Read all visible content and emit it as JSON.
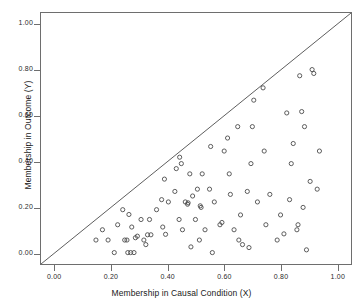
{
  "chart_data": {
    "type": "scatter",
    "title": "",
    "xlabel": "Membership in Causal Condition (X)",
    "ylabel": "Membership in Outcome (Y)",
    "xlim": [
      -0.05,
      1.05
    ],
    "ylim": [
      -0.05,
      1.05
    ],
    "xticks": [
      0.0,
      0.2,
      0.4,
      0.6,
      0.8,
      1.0
    ],
    "yticks": [
      0.0,
      0.2,
      0.4,
      0.6,
      0.8,
      1.0
    ],
    "xticklabels": [
      "0.00",
      "0.20",
      "0.40",
      "0.60",
      "0.80",
      "1.00"
    ],
    "yticklabels": [
      "0.00",
      "0.20",
      "0.40",
      "0.60",
      "0.80",
      "1.00"
    ],
    "grid": false,
    "legend": null,
    "marker": "open-circle",
    "marker_color": "#4a4a4a",
    "frame_color": "#6e6e6e",
    "reference_line": {
      "name": "y = x diagonal",
      "from": [
        -0.05,
        -0.05
      ],
      "to": [
        1.05,
        1.05
      ],
      "color": "#4a4a4a"
    },
    "points": [
      [
        0.145,
        0.055
      ],
      [
        0.168,
        0.1
      ],
      [
        0.188,
        0.055
      ],
      [
        0.21,
        0.0
      ],
      [
        0.222,
        0.122
      ],
      [
        0.24,
        0.188
      ],
      [
        0.247,
        0.055
      ],
      [
        0.255,
        0.055
      ],
      [
        0.258,
        0.0
      ],
      [
        0.262,
        0.167
      ],
      [
        0.268,
        0.0
      ],
      [
        0.272,
        0.112
      ],
      [
        0.28,
        0.0
      ],
      [
        0.285,
        0.065
      ],
      [
        0.292,
        0.072
      ],
      [
        0.305,
        0.145
      ],
      [
        0.315,
        0.055
      ],
      [
        0.322,
        0.035
      ],
      [
        0.328,
        0.078
      ],
      [
        0.335,
        0.145
      ],
      [
        0.34,
        0.078
      ],
      [
        0.36,
        0.188
      ],
      [
        0.378,
        0.232
      ],
      [
        0.382,
        0.112
      ],
      [
        0.388,
        0.322
      ],
      [
        0.392,
        0.08
      ],
      [
        0.402,
        0.222
      ],
      [
        0.425,
        0.268
      ],
      [
        0.43,
        0.368
      ],
      [
        0.44,
        0.145
      ],
      [
        0.442,
        0.418
      ],
      [
        0.448,
        0.39
      ],
      [
        0.452,
        0.1
      ],
      [
        0.462,
        0.222
      ],
      [
        0.47,
        0.212
      ],
      [
        0.472,
        0.218
      ],
      [
        0.478,
        0.345
      ],
      [
        0.482,
        0.025
      ],
      [
        0.488,
        0.248
      ],
      [
        0.498,
        0.145
      ],
      [
        0.505,
        0.278
      ],
      [
        0.512,
        0.055
      ],
      [
        0.515,
        0.205
      ],
      [
        0.518,
        0.198
      ],
      [
        0.522,
        0.345
      ],
      [
        0.532,
        0.1
      ],
      [
        0.548,
        0.278
      ],
      [
        0.552,
        0.465
      ],
      [
        0.558,
        0.0
      ],
      [
        0.565,
        0.222
      ],
      [
        0.585,
        0.122
      ],
      [
        0.592,
        0.132
      ],
      [
        0.6,
        0.445
      ],
      [
        0.612,
        0.502
      ],
      [
        0.618,
        0.345
      ],
      [
        0.622,
        0.255
      ],
      [
        0.635,
        0.1
      ],
      [
        0.648,
        0.552
      ],
      [
        0.652,
        0.055
      ],
      [
        0.658,
        0.165
      ],
      [
        0.665,
        0.035
      ],
      [
        0.682,
        0.268
      ],
      [
        0.688,
        0.022
      ],
      [
        0.695,
        0.39
      ],
      [
        0.7,
        0.552
      ],
      [
        0.705,
        0.668
      ],
      [
        0.718,
        0.222
      ],
      [
        0.738,
        0.722
      ],
      [
        0.742,
        0.445
      ],
      [
        0.748,
        0.122
      ],
      [
        0.762,
        0.255
      ],
      [
        0.788,
        0.055
      ],
      [
        0.8,
        0.165
      ],
      [
        0.812,
        0.082
      ],
      [
        0.822,
        0.612
      ],
      [
        0.832,
        0.232
      ],
      [
        0.838,
        0.39
      ],
      [
        0.845,
        0.478
      ],
      [
        0.858,
        0.1
      ],
      [
        0.862,
        0.122
      ],
      [
        0.868,
        0.775
      ],
      [
        0.875,
        0.618
      ],
      [
        0.88,
        0.198
      ],
      [
        0.885,
        0.552
      ],
      [
        0.892,
        0.012
      ],
      [
        0.905,
        0.312
      ],
      [
        0.912,
        0.802
      ],
      [
        0.918,
        0.785
      ],
      [
        0.93,
        0.278
      ],
      [
        0.938,
        0.445
      ]
    ]
  }
}
